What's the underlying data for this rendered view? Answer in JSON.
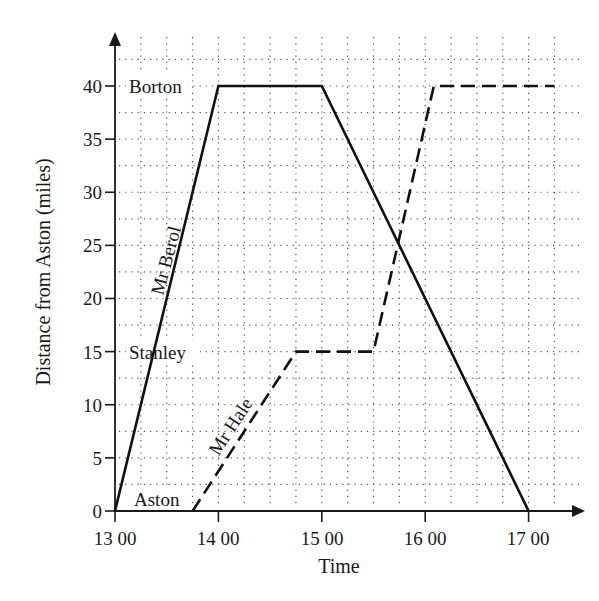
{
  "chart_data": {
    "type": "line",
    "title": "",
    "xlabel": "Time",
    "ylabel": "Distance from Aston (miles)",
    "x_ticks": [
      "13 00",
      "14 00",
      "15 00",
      "16 00",
      "17 00"
    ],
    "y_ticks": [
      0,
      5,
      10,
      15,
      20,
      25,
      30,
      35,
      40
    ],
    "xlim": [
      "13 00",
      "17 20"
    ],
    "ylim": [
      0,
      43
    ],
    "grid": true,
    "grid_minor": {
      "x_step_minutes": 15,
      "y_step_miles": 2.5
    },
    "place_labels": [
      {
        "label": "Borton",
        "distance": 40
      },
      {
        "label": "Stanley",
        "distance": 15
      },
      {
        "label": "Aston",
        "distance": 0
      }
    ],
    "series": [
      {
        "name": "Mr Berol",
        "style": "solid",
        "points": [
          {
            "time": "13 00",
            "distance": 0
          },
          {
            "time": "14 00",
            "distance": 40
          },
          {
            "time": "15 00",
            "distance": 40
          },
          {
            "time": "17 00",
            "distance": 0
          }
        ]
      },
      {
        "name": "Mr Hale",
        "style": "dashed",
        "points": [
          {
            "time": "13 45",
            "distance": 0
          },
          {
            "time": "14 45",
            "distance": 15
          },
          {
            "time": "15 30",
            "distance": 15
          },
          {
            "time": "16 05",
            "distance": 40
          },
          {
            "time": "17 15",
            "distance": 40
          }
        ]
      }
    ]
  },
  "labels": {
    "xlabel": "Time",
    "ylabel": "Distance from Aston (miles)",
    "x_ticks": [
      "13 00",
      "14 00",
      "15 00",
      "16 00",
      "17 00"
    ],
    "y_ticks": [
      "0",
      "5",
      "10",
      "15",
      "20",
      "25",
      "30",
      "35",
      "40"
    ],
    "places": {
      "borton": "Borton",
      "stanley": "Stanley",
      "aston": "Aston"
    },
    "series": {
      "berol": "Mr Berol",
      "hale": "Mr Hale"
    }
  }
}
